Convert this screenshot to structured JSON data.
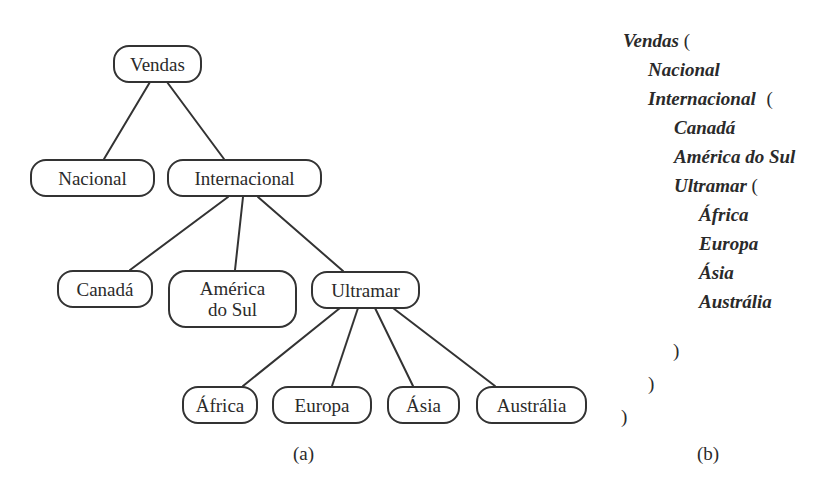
{
  "figure_a": {
    "caption": "(a)",
    "nodes": {
      "vendas": "Vendas",
      "nacional": "Nacional",
      "internacional": "Internacional",
      "canada": "Canadá",
      "america_do_sul_line1": "América",
      "america_do_sul_line2": "do Sul",
      "ultramar": "Ultramar",
      "africa": "África",
      "europa": "Europa",
      "asia": "Ásia",
      "australia": "Austrália"
    },
    "edges": [
      [
        "Vendas",
        "Nacional"
      ],
      [
        "Vendas",
        "Internacional"
      ],
      [
        "Internacional",
        "Canadá"
      ],
      [
        "Internacional",
        "América do Sul"
      ],
      [
        "Internacional",
        "Ultramar"
      ],
      [
        "Ultramar",
        "África"
      ],
      [
        "Ultramar",
        "Europa"
      ],
      [
        "Ultramar",
        "Ásia"
      ],
      [
        "Ultramar",
        "Austrália"
      ]
    ]
  },
  "figure_b": {
    "caption": "(b)",
    "lines": {
      "vendas": "Vendas",
      "nacional": "Nacional",
      "internacional": "Internacional",
      "canada": "Canadá",
      "america_do_sul": "América do Sul",
      "ultramar": "Ultramar",
      "africa": "África",
      "europa": "Europa",
      "asia": "Ásia",
      "australia": "Austrália"
    },
    "open_paren": "(",
    "close_paren": ")"
  },
  "colors": {
    "line": "#333333",
    "text": "#2a2a2a",
    "background": "#ffffff"
  }
}
